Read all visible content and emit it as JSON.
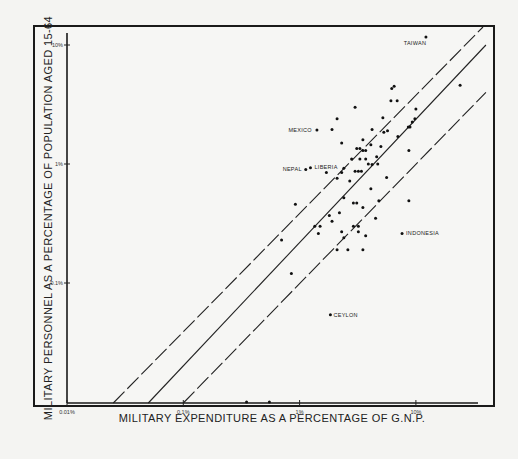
{
  "chart_data": {
    "type": "scatter",
    "title": "",
    "xlabel": "MILITARY EXPENDITURE AS A PERCENTAGE OF  G.N.P.",
    "ylabel": "MILITARY PERSONNEL AS A PERCENTAGE OF POPULATION AGED 15-64",
    "x_scale": "log",
    "y_scale": "log",
    "xlim": [
      0.01,
      40
    ],
    "ylim": [
      0.01,
      13
    ],
    "x_ticks": [
      {
        "value": 0.01,
        "label": "0.01%"
      },
      {
        "value": 0.1,
        "label": "0.1%"
      },
      {
        "value": 1,
        "label": "1%"
      },
      {
        "value": 10,
        "label": "10%"
      }
    ],
    "y_ticks": [
      {
        "value": 10,
        "label": "10%"
      },
      {
        "value": 1,
        "label": "1%"
      },
      {
        "value": 0.1,
        "label": "0.1%"
      }
    ],
    "grid": false,
    "legend": null,
    "reference_lines": [
      {
        "name": "upper-band",
        "style": "dashed",
        "x": [
          0.025,
          40
        ],
        "y": [
          0.01,
          15
        ]
      },
      {
        "name": "regression",
        "style": "solid",
        "x": [
          0.05,
          40
        ],
        "y": [
          0.01,
          10
        ]
      },
      {
        "name": "lower-band",
        "style": "dashed",
        "x": [
          0.1,
          40
        ],
        "y": [
          0.01,
          4
        ]
      }
    ],
    "labeled_points": [
      {
        "label": "TAIWAN",
        "x": 12.2,
        "y": 11.7
      },
      {
        "label": "MEXICO",
        "x": 1.41,
        "y": 1.93
      },
      {
        "label": "LIBERIA",
        "x": 1.24,
        "y": 0.93
      },
      {
        "label": "NEPAL",
        "x": 1.13,
        "y": 0.9
      },
      {
        "label": "INDONESIA",
        "x": 7.6,
        "y": 0.26
      },
      {
        "label": "CEYLON",
        "x": 1.84,
        "y": 0.054
      }
    ],
    "points": [
      [
        24,
        4.6
      ],
      [
        6.5,
        4.5
      ],
      [
        6.2,
        4.3
      ],
      [
        6.1,
        3.4
      ],
      [
        6.9,
        3.4
      ],
      [
        3.0,
        3.0
      ],
      [
        2.1,
        2.4
      ],
      [
        5.2,
        2.45
      ],
      [
        10.0,
        2.9
      ],
      [
        9.3,
        2.25
      ],
      [
        9.8,
        2.4
      ],
      [
        8.6,
        2.05
      ],
      [
        8.9,
        2.05
      ],
      [
        1.9,
        1.95
      ],
      [
        4.2,
        1.95
      ],
      [
        5.3,
        1.85
      ],
      [
        5.7,
        1.9
      ],
      [
        7.0,
        1.7
      ],
      [
        3.5,
        1.6
      ],
      [
        4.1,
        1.45
      ],
      [
        2.3,
        1.5
      ],
      [
        5.0,
        1.4
      ],
      [
        3.1,
        1.35
      ],
      [
        3.3,
        1.35
      ],
      [
        3.5,
        1.3
      ],
      [
        3.7,
        1.3
      ],
      [
        8.7,
        1.3
      ],
      [
        4.6,
        1.15
      ],
      [
        2.8,
        1.1
      ],
      [
        3.3,
        1.1
      ],
      [
        3.7,
        1.1
      ],
      [
        3.9,
        1.0
      ],
      [
        4.2,
        0.99
      ],
      [
        4.7,
        1.0
      ],
      [
        2.4,
        0.92
      ],
      [
        3.0,
        0.87
      ],
      [
        3.2,
        0.87
      ],
      [
        3.4,
        0.87
      ],
      [
        1.7,
        0.85
      ],
      [
        2.3,
        0.85
      ],
      [
        2.1,
        0.76
      ],
      [
        2.7,
        0.72
      ],
      [
        5.6,
        0.77
      ],
      [
        4.1,
        0.62
      ],
      [
        2.4,
        0.52
      ],
      [
        2.9,
        0.47
      ],
      [
        3.1,
        0.47
      ],
      [
        3.5,
        0.43
      ],
      [
        4.8,
        0.49
      ],
      [
        0.92,
        0.46
      ],
      [
        8.7,
        0.49
      ],
      [
        2.2,
        0.39
      ],
      [
        4.5,
        0.35
      ],
      [
        1.9,
        0.33
      ],
      [
        1.8,
        0.37
      ],
      [
        2.9,
        0.3
      ],
      [
        3.2,
        0.3
      ],
      [
        3.2,
        0.27
      ],
      [
        1.35,
        0.3
      ],
      [
        1.5,
        0.3
      ],
      [
        1.45,
        0.26
      ],
      [
        2.3,
        0.27
      ],
      [
        3.7,
        0.25
      ],
      [
        2.4,
        0.24
      ],
      [
        0.7,
        0.23
      ],
      [
        2.1,
        0.19
      ],
      [
        2.6,
        0.19
      ],
      [
        3.5,
        0.19
      ],
      [
        0.85,
        0.12
      ],
      [
        0.35,
        0.01
      ],
      [
        0.55,
        0.01
      ]
    ]
  }
}
